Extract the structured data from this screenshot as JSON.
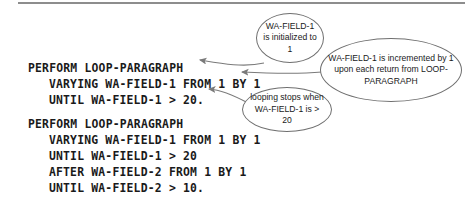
{
  "figure": {
    "type": "annotated-code-listing",
    "language": "COBOL",
    "divider": "horizontal-rule"
  },
  "code_blocks": [
    {
      "id": "block-1",
      "lines": [
        {
          "text": "PERFORM LOOP-PARAGRAPH",
          "indent": 0
        },
        {
          "text": "VARYING WA-FIELD-1 FROM 1 BY 1",
          "indent": 1
        },
        {
          "text": "UNTIL WA-FIELD-1 > 20.",
          "indent": 1
        }
      ]
    },
    {
      "id": "block-2",
      "lines": [
        {
          "text": "PERFORM LOOP-PARAGRAPH",
          "indent": 0
        },
        {
          "text": "VARYING WA-FIELD-1 FROM 1 BY 1",
          "indent": 1
        },
        {
          "text": "UNTIL WA-FIELD-1 > 20",
          "indent": 1
        },
        {
          "text": "AFTER WA-FIELD-2 FROM 1 BY 1",
          "indent": 1
        },
        {
          "text": "UNTIL WA-FIELD-2 > 10.",
          "indent": 1
        }
      ]
    }
  ],
  "callouts": [
    {
      "id": "init",
      "text": "WA-FIELD-1 is initialized to 1",
      "points_to": "VARYING WA-FIELD-1 FROM 1 BY 1"
    },
    {
      "id": "increment",
      "text": "WA-FIELD-1 is incremented by 1 upon each return from LOOP-PARAGRAPH",
      "points_to": "VARYING WA-FIELD-1 FROM 1 BY 1"
    },
    {
      "id": "stop",
      "text": "looping stops when WA-FIELD-1 is > 20",
      "points_to": "UNTIL WA-FIELD-1 > 20."
    }
  ],
  "colors": {
    "background": "#ffffff",
    "code_text": "#1a1a1a",
    "bubble_stroke": "#6f6f6f",
    "rule": "#8d8d8d",
    "arrow": "#7a7a7a"
  }
}
